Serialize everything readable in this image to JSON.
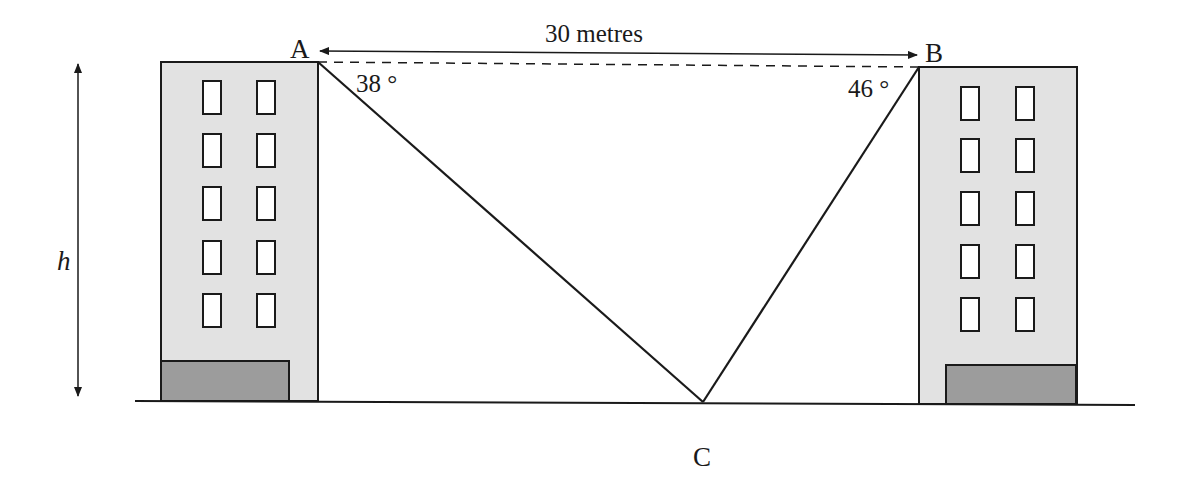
{
  "diagram": {
    "type": "angles-of-depression",
    "labels": {
      "point_a": "A",
      "point_b": "B",
      "point_c": "C",
      "height": "h",
      "distance": "30 metres",
      "angle_a": "38 °",
      "angle_b": "46 °"
    },
    "colors": {
      "stroke": "#1a1a1a",
      "building_fill": "#e2e2e2",
      "annex_fill": "#9c9c9c",
      "window_fill": "#ffffff",
      "background": "#ffffff"
    },
    "buildings": [
      {
        "name": "left-building",
        "floors_with_windows": 5,
        "windows_per_floor": 2
      },
      {
        "name": "right-building",
        "floors_with_windows": 5,
        "windows_per_floor": 2
      }
    ]
  }
}
